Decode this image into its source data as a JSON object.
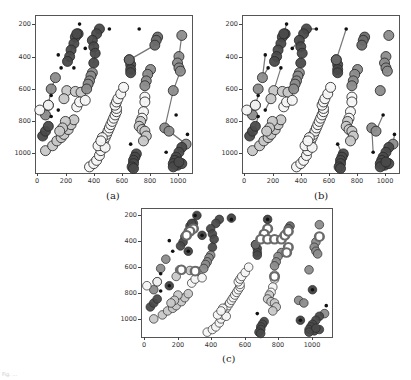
{
  "figure": {
    "panels": [
      {
        "id": "a",
        "caption": "(a)"
      },
      {
        "id": "b",
        "caption": "(b)"
      },
      {
        "id": "c",
        "caption": "(c)"
      }
    ],
    "footnote": "Fig. ..."
  },
  "colors": {
    "dark": "#4a4a4a",
    "darkmid": "#6a6a6a",
    "mid": "#8c8c8c",
    "light": "#c8c8c8",
    "white": "#f6f6f6",
    "edge": "#2a2a2a",
    "dot": "#111111",
    "line": "#777777"
  },
  "chart_data": [
    {
      "type": "scatter",
      "title": "(a)",
      "xlabel": "",
      "ylabel": "",
      "xlim": [
        -14,
        1099
      ],
      "ylim": [
        1124,
        144
      ],
      "xticks": [
        0,
        200,
        400,
        600,
        800,
        1000
      ],
      "yticks": [
        200,
        400,
        600,
        800,
        1000
      ],
      "grid": false,
      "tracks": [
        {
          "shade": "dark",
          "points": [
            [
              290,
              260
            ],
            [
              270,
              280
            ],
            [
              260,
              320
            ],
            [
              240,
              360
            ],
            [
              230,
              400
            ],
            [
              215,
              430
            ],
            [
              280,
              260
            ]
          ],
          "line": true
        },
        {
          "shade": "dark",
          "points": [
            [
              440,
              230
            ],
            [
              420,
              260
            ],
            [
              390,
              300
            ],
            [
              400,
              340
            ],
            [
              410,
              380
            ],
            [
              400,
              440
            ]
          ],
          "line": true
        },
        {
          "shade": "mid",
          "points": [
            [
              130,
              530
            ],
            [
              100,
              600
            ],
            [
              80,
              700
            ],
            [
              60,
              760
            ]
          ],
          "line": true
        },
        {
          "shade": "dark",
          "points": [
            [
              40,
              890
            ],
            [
              60,
              860
            ],
            [
              80,
              830
            ]
          ],
          "line": false
        },
        {
          "shade": "light",
          "points": [
            [
              60,
              980
            ],
            [
              110,
              950
            ],
            [
              140,
              920
            ],
            [
              170,
              900
            ],
            [
              190,
              880
            ],
            [
              220,
              850
            ],
            [
              240,
              820
            ],
            [
              260,
              790
            ],
            [
              200,
              800
            ],
            [
              180,
              840
            ],
            [
              160,
              860
            ]
          ],
          "line": false
        },
        {
          "shade": "light",
          "points": [
            [
              210,
              610
            ],
            [
              190,
              660
            ],
            [
              270,
              615
            ],
            [
              310,
              620
            ]
          ],
          "line": false
        },
        {
          "shade": "white",
          "points": [
            [
              20,
              730
            ],
            [
              80,
              700
            ],
            [
              280,
              710
            ],
            [
              300,
              680
            ],
            [
              340,
              670
            ]
          ],
          "line": false
        },
        {
          "shade": "mid",
          "points": [
            [
              390,
              500
            ],
            [
              380,
              520
            ],
            [
              370,
              550
            ],
            [
              360,
              570
            ],
            [
              350,
              600
            ]
          ],
          "line": false
        },
        {
          "shade": "white",
          "points": [
            [
              370,
              1080
            ],
            [
              400,
              1060
            ],
            [
              420,
              1040
            ],
            [
              440,
              1010
            ],
            [
              450,
              980
            ],
            [
              460,
              950
            ],
            [
              470,
              920
            ],
            [
              480,
              900
            ],
            [
              490,
              880
            ],
            [
              500,
              860
            ],
            [
              510,
              840
            ],
            [
              520,
              820
            ],
            [
              530,
              800
            ],
            [
              540,
              780
            ],
            [
              550,
              760
            ],
            [
              560,
              740
            ],
            [
              560,
              720
            ],
            [
              550,
              700
            ],
            [
              560,
              680
            ],
            [
              570,
              660
            ],
            [
              590,
              630
            ],
            [
              610,
              590
            ],
            [
              430,
              950
            ],
            [
              460,
              900
            ],
            [
              480,
              960
            ],
            [
              450,
              920
            ]
          ],
          "line": false
        },
        {
          "shade": "dark",
          "points": [
            [
              650,
              420
            ],
            [
              660,
              450
            ],
            [
              660,
              480
            ],
            [
              660,
              500
            ]
          ],
          "line": true
        },
        {
          "shade": "darkmid",
          "points": [
            [
              850,
              280
            ],
            [
              840,
              300
            ],
            [
              830,
              330
            ],
            [
              650,
              420
            ]
          ],
          "line": true
        },
        {
          "shade": "mid",
          "points": [
            [
              800,
              480
            ],
            [
              780,
              510
            ],
            [
              770,
              550
            ],
            [
              760,
              580
            ]
          ],
          "line": true
        },
        {
          "shade": "white",
          "points": [
            [
              760,
              650
            ],
            [
              760,
              680
            ],
            [
              750,
              740
            ],
            [
              740,
              780
            ]
          ],
          "line": true
        },
        {
          "shade": "light",
          "points": [
            [
              730,
              800
            ],
            [
              720,
              830
            ],
            [
              740,
              850
            ],
            [
              760,
              860
            ],
            [
              770,
              890
            ],
            [
              750,
              920
            ]
          ],
          "line": false
        },
        {
          "shade": "dark",
          "points": [
            [
              700,
              1000
            ],
            [
              690,
              1020
            ],
            [
              680,
              1040
            ],
            [
              680,
              1060
            ],
            [
              670,
              1080
            ],
            [
              680,
              1090
            ]
          ],
          "line": false
        },
        {
          "shade": "mid",
          "points": [
            [
              1020,
              270
            ],
            [
              1000,
              400
            ],
            [
              990,
              440
            ],
            [
              1000,
              470
            ],
            [
              1010,
              490
            ],
            [
              960,
              610
            ],
            [
              900,
              840
            ],
            [
              930,
              860
            ],
            [
              1050,
              940
            ]
          ],
          "line": true
        },
        {
          "shade": "dark",
          "points": [
            [
              1020,
              960
            ],
            [
              1000,
              990
            ],
            [
              980,
              1020
            ],
            [
              970,
              1040
            ],
            [
              960,
              1060
            ],
            [
              990,
              1070
            ],
            [
              1020,
              1060
            ],
            [
              960,
              1080
            ],
            [
              1000,
              1050
            ]
          ],
          "line": false
        }
      ],
      "dots": [
        [
          300,
          200
        ],
        [
          510,
          230
        ],
        [
          720,
          230
        ],
        [
          150,
          390
        ],
        [
          170,
          470
        ],
        [
          260,
          470
        ],
        [
          340,
          350
        ],
        [
          100,
          640
        ],
        [
          150,
          730
        ],
        [
          100,
          770
        ],
        [
          980,
          760
        ],
        [
          660,
          940
        ],
        [
          910,
          990
        ],
        [
          1060,
          880
        ]
      ]
    },
    {
      "type": "scatter",
      "title": "(b)",
      "xlim": [
        -14,
        1099
      ],
      "ylim": [
        1124,
        144
      ],
      "xticks": [
        0,
        200,
        400,
        600,
        800,
        1000
      ],
      "yticks": [
        200,
        400,
        600,
        800,
        1000
      ],
      "grid": false,
      "note": "Same clusters as (a); each black dot linked by a line segment to its nearest cluster marker",
      "links": [
        [
          [
            300,
            200
          ],
          [
            280,
            260
          ]
        ],
        [
          [
            510,
            230
          ],
          [
            440,
            230
          ]
        ],
        [
          [
            720,
            230
          ],
          [
            650,
            420
          ]
        ],
        [
          [
            150,
            390
          ],
          [
            130,
            530
          ]
        ],
        [
          [
            170,
            470
          ],
          [
            130,
            530
          ]
        ],
        [
          [
            260,
            470
          ],
          [
            210,
            610
          ]
        ],
        [
          [
            340,
            350
          ],
          [
            390,
            300
          ]
        ],
        [
          [
            100,
            640
          ],
          [
            80,
            700
          ]
        ],
        [
          [
            150,
            730
          ],
          [
            190,
            660
          ]
        ],
        [
          [
            100,
            770
          ],
          [
            80,
            830
          ]
        ],
        [
          [
            980,
            760
          ],
          [
            930,
            860
          ]
        ],
        [
          [
            660,
            940
          ],
          [
            690,
            1000
          ]
        ],
        [
          [
            910,
            990
          ],
          [
            900,
            840
          ]
        ],
        [
          [
            1060,
            880
          ],
          [
            1050,
            940
          ]
        ]
      ]
    },
    {
      "type": "scatter",
      "title": "(c)",
      "xlim": [
        -14,
        1099
      ],
      "ylim": [
        1124,
        144
      ],
      "xticks": [
        0,
        200,
        400,
        600,
        800,
        1000
      ],
      "yticks": [
        200,
        400,
        600,
        800,
        1000
      ],
      "grid": false,
      "note": "Clusters without connecting lines; some markers drawn as hollow rings and some with a black dot at centre",
      "rings": [
        [
          720,
          300
        ],
        [
          700,
          340
        ],
        [
          680,
          380
        ],
        [
          720,
          380
        ],
        [
          760,
          380
        ],
        [
          800,
          380
        ],
        [
          820,
          350
        ],
        [
          840,
          320
        ],
        [
          840,
          440
        ],
        [
          830,
          480
        ],
        [
          290,
          300
        ],
        [
          270,
          320
        ],
        [
          250,
          350
        ],
        [
          760,
          660
        ],
        [
          1020,
          360
        ],
        [
          220,
          610
        ],
        [
          300,
          620
        ]
      ],
      "centered": [
        [
          310,
          200
        ],
        [
          510,
          220
        ],
        [
          720,
          230
        ],
        [
          340,
          350
        ],
        [
          260,
          470
        ],
        [
          150,
          730
        ],
        [
          980,
          760
        ],
        [
          910,
          990
        ]
      ]
    }
  ]
}
